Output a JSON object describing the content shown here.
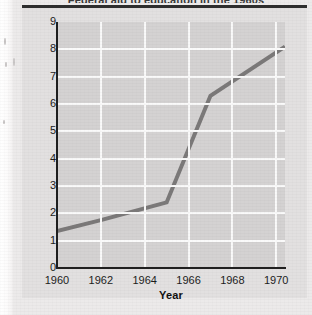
{
  "figure": {
    "title_cropped": "Federal aid to education in the 1960s",
    "y_axis_title": "Billions of dollars",
    "x_axis_title": "Year",
    "plot_bg_color": "#d4d2d2",
    "page_bg_color": "#eceaea",
    "line_color": "#7b7979",
    "grid_color": "#fafafa",
    "axis_color": "#1f1f1f"
  },
  "chart_data": {
    "type": "line",
    "title": "Federal aid to education in the 1960s",
    "xlabel": "Year",
    "ylabel": "Billions of dollars",
    "xlim": [
      1960,
      1970.4
    ],
    "ylim": [
      0,
      9
    ],
    "grid": true,
    "legend": "none",
    "xticks": [
      "1960",
      "1962",
      "1964",
      "1966",
      "1968",
      "1970"
    ],
    "xtick_values": [
      1960,
      1962,
      1964,
      1966,
      1968,
      1970
    ],
    "yticks": [
      "0",
      "1",
      "2",
      "3",
      "4",
      "5",
      "6",
      "7",
      "8",
      "9"
    ],
    "ytick_values": [
      0,
      1,
      2,
      3,
      4,
      5,
      6,
      7,
      8,
      9
    ],
    "x": [
      1960,
      1962,
      1965,
      1967,
      1970.4
    ],
    "values": [
      1.35,
      1.75,
      2.4,
      6.3,
      8.1
    ],
    "series": [
      {
        "name": "Billions of dollars",
        "x": [
          1960,
          1962,
          1965,
          1967,
          1970.4
        ],
        "values": [
          1.35,
          1.75,
          2.4,
          6.3,
          8.1
        ]
      }
    ]
  }
}
